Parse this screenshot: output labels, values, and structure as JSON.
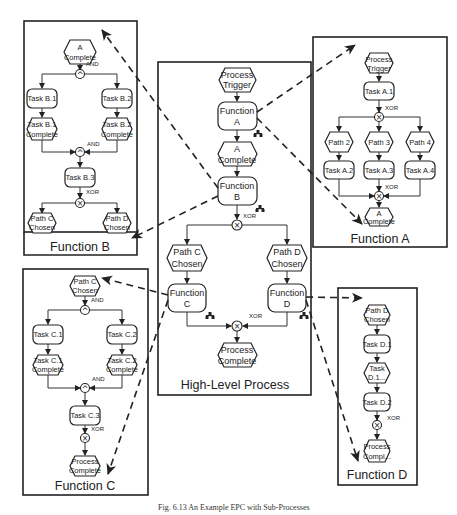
{
  "figure": {
    "caption": "Fig. 6.13 An Example EPC with Sub-Processes"
  },
  "high_level": {
    "title": "High-Level Process",
    "process_trigger": [
      "Process",
      "Trigger"
    ],
    "function_a": [
      "Function",
      "A"
    ],
    "a_complete": [
      "A",
      "Complete"
    ],
    "function_b": [
      "Function",
      "B"
    ],
    "xor_split": "XOR",
    "path_c": [
      "Path C",
      "Chosen"
    ],
    "path_d": [
      "Path D",
      "Chosen"
    ],
    "function_c": [
      "Function",
      "C"
    ],
    "function_d": [
      "Function",
      "D"
    ],
    "xor_join": "XOR",
    "process_complete": [
      "Process",
      "Complete"
    ]
  },
  "function_a": {
    "title": "Function A",
    "process_trigger": [
      "Process",
      "Trigger"
    ],
    "task_a1": "Task A.1",
    "xor_split": "XOR",
    "paths": [
      "Path 2",
      "Path 3",
      "Path 4"
    ],
    "tasks": [
      "Task A.2",
      "Task A.3",
      "Task A.4"
    ],
    "xor_join": "XOR",
    "a_complete": [
      "A",
      "Complete"
    ]
  },
  "function_b": {
    "title": "Function B",
    "a_complete": [
      "A",
      "Complete"
    ],
    "and_split": "AND",
    "task_b1": "Task B.1",
    "task_b2": "Task B.2",
    "b1_complete": [
      "Task B.1",
      "Complete"
    ],
    "b2_complete": [
      "Task B.2",
      "Complete"
    ],
    "and_join": "AND",
    "task_b3": "Task B.3",
    "xor_split": "XOR",
    "path_c": [
      "Path C",
      "Chosen"
    ],
    "path_d": [
      "Path D",
      "Chosen"
    ]
  },
  "function_c": {
    "title": "Function C",
    "path_c": [
      "Path C",
      "Chosen"
    ],
    "and_split": "AND",
    "task_c1": "Task C.1",
    "task_c2": "Task C.2",
    "c1_complete": [
      "Task C.1",
      "Complete"
    ],
    "c2_complete": [
      "Task C.2",
      "Complete"
    ],
    "and_join": "AND",
    "task_c3": "Task C.3",
    "xor": "XOR",
    "process_complete": [
      "Process",
      "Complete"
    ]
  },
  "function_d": {
    "title": "Function D",
    "path_d": [
      "Path D",
      "Chosen"
    ],
    "task_d1": "Task D.1",
    "d1_event": [
      "Task",
      "D.1..."
    ],
    "task_d2": "Task D.2",
    "xor": "XOR",
    "process_complete": [
      "Process",
      "Compl..."
    ]
  },
  "gate_symbols": {
    "and": "^",
    "xor": "×"
  }
}
